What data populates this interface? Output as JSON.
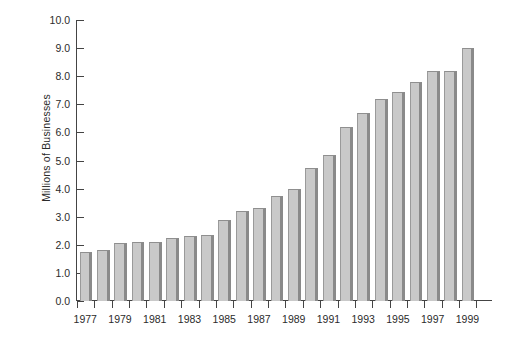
{
  "chart_data": {
    "type": "bar",
    "title": "",
    "subtitle": "",
    "xlabel": "",
    "ylabel": "Millions of Businesses",
    "ylim": [
      0.0,
      10.0
    ],
    "ytick_labels": [
      "0.0",
      "1.0",
      "2.0",
      "3.0",
      "4.0",
      "5.0",
      "6.0",
      "7.0",
      "8.0",
      "9.0",
      "10.0"
    ],
    "ytick_values": [
      0.0,
      1.0,
      2.0,
      3.0,
      4.0,
      5.0,
      6.0,
      7.0,
      8.0,
      9.0,
      10.0
    ],
    "grid": false,
    "legend": null,
    "categories": [
      "1977",
      "1978",
      "1979",
      "1980",
      "1981",
      "1982",
      "1983",
      "1984",
      "1985",
      "1986",
      "1987",
      "1988",
      "1989",
      "1990",
      "1991",
      "1992",
      "1993",
      "1994",
      "1995",
      "1996",
      "1997",
      "1998",
      "1999"
    ],
    "xtick_labels_shown": [
      "1977",
      "1979",
      "1981",
      "1983",
      "1985",
      "1987",
      "1989",
      "1991",
      "1993",
      "1995",
      "1997",
      "1999"
    ],
    "values": [
      1.75,
      1.8,
      2.05,
      2.1,
      2.1,
      2.25,
      2.3,
      2.35,
      2.9,
      3.2,
      3.3,
      3.75,
      4.0,
      4.75,
      5.2,
      6.2,
      6.7,
      7.2,
      7.45,
      7.8,
      8.2,
      8.2,
      9.0
    ],
    "bar_color": "#c9c9c9",
    "bar_edge_color": "#8a8a8a",
    "axis_color": "#444444",
    "text_color": "#2b2b2b",
    "background_color": "#ffffff"
  }
}
